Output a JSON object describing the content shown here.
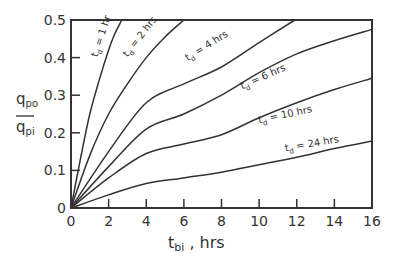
{
  "chart_data": {
    "type": "line",
    "title": "",
    "xlabel": "t_bi , hrs",
    "xlabel_main": "t",
    "xlabel_sub": "bi",
    "xlabel_suffix": " , hrs",
    "ylabel": "q_po / q_pi",
    "ylabel_num": "q",
    "ylabel_num_sub": "po",
    "ylabel_den": "q",
    "ylabel_den_sub": "pi",
    "xlim": [
      0,
      16
    ],
    "ylim": [
      0,
      0.5
    ],
    "xticks": [
      0,
      2,
      4,
      6,
      8,
      10,
      12,
      14,
      16
    ],
    "xtick_labels": [
      "0",
      "2",
      "4",
      "6",
      "8",
      "10",
      "12",
      "14",
      "16"
    ],
    "yticks": [
      0,
      0.1,
      0.2,
      0.3,
      0.4,
      0.5
    ],
    "ytick_labels": [
      "0",
      "0.1",
      "0.2",
      "0.3",
      "0.4",
      "0.5"
    ],
    "grid": false,
    "legend": "inline labels on curves",
    "line_color": "#333333",
    "series": [
      {
        "name": "t_d = 1 hr",
        "label_main": "t",
        "label_sub": "d",
        "label_rest": " = 1 hr",
        "x": [
          0,
          0.5,
          1,
          1.5,
          2,
          2.3,
          2.7
        ],
        "y": [
          0,
          0.13,
          0.25,
          0.34,
          0.42,
          0.46,
          0.5
        ]
      },
      {
        "name": "t_d = 2 hrs",
        "label_main": "t",
        "label_sub": "d",
        "label_rest": " = 2 hrs",
        "x": [
          0,
          1,
          2,
          3,
          4,
          5,
          6.0
        ],
        "y": [
          0,
          0.14,
          0.25,
          0.33,
          0.4,
          0.455,
          0.5
        ]
      },
      {
        "name": "t_d = 4 hrs",
        "label_main": "t",
        "label_sub": "d",
        "label_rest": " = 4 hrs",
        "x": [
          0,
          2,
          4,
          6,
          8,
          10,
          11.9
        ],
        "y": [
          0,
          0.15,
          0.28,
          0.33,
          0.375,
          0.44,
          0.5
        ]
      },
      {
        "name": "t_d = 6 hrs",
        "label_main": "t",
        "label_sub": "d",
        "label_rest": " = 6 hrs",
        "x": [
          0,
          2,
          4,
          6,
          8,
          10,
          12,
          14,
          16
        ],
        "y": [
          0,
          0.11,
          0.21,
          0.25,
          0.3,
          0.36,
          0.41,
          0.445,
          0.475
        ]
      },
      {
        "name": "t_d = 10 hrs",
        "label_main": "t",
        "label_sub": "d",
        "label_rest": " = 10 hrs",
        "x": [
          0,
          2,
          4,
          6,
          8,
          10,
          12,
          14,
          16
        ],
        "y": [
          0,
          0.08,
          0.145,
          0.17,
          0.195,
          0.24,
          0.28,
          0.315,
          0.345
        ]
      },
      {
        "name": "t_d = 24 hrs",
        "label_main": "t",
        "label_sub": "d",
        "label_rest": " = 24 hrs",
        "x": [
          0,
          2,
          4,
          6,
          8,
          10,
          12,
          14,
          16
        ],
        "y": [
          0,
          0.035,
          0.065,
          0.08,
          0.095,
          0.115,
          0.135,
          0.158,
          0.178
        ]
      }
    ],
    "annotations": [
      {
        "series": "t_d = 1 hr",
        "x": 1.4,
        "y": 0.4,
        "angle": -72
      },
      {
        "series": "t_d = 2 hrs",
        "x": 3.0,
        "y": 0.4,
        "angle": -52
      },
      {
        "series": "t_d = 4 hrs",
        "x": 6.2,
        "y": 0.39,
        "angle": -32
      },
      {
        "series": "t_d = 6 hrs",
        "x": 9.1,
        "y": 0.315,
        "angle": -24
      },
      {
        "series": "t_d = 10 hrs",
        "x": 10.0,
        "y": 0.225,
        "angle": -12
      },
      {
        "series": "t_d = 24 hrs",
        "x": 11.4,
        "y": 0.15,
        "angle": -10
      }
    ]
  }
}
